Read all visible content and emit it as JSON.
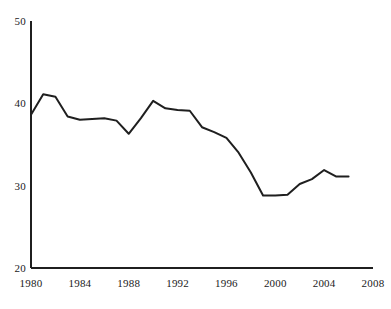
{
  "chart_data": {
    "type": "line",
    "title": "",
    "subtitle": "",
    "xlabel": "",
    "ylabel": "",
    "xlim": [
      1980,
      2008
    ],
    "ylim": [
      20,
      50
    ],
    "grid": false,
    "legend": null,
    "x_ticks": [
      "1980",
      "1984",
      "1988",
      "1992",
      "1996",
      "2000",
      "2004",
      "2008"
    ],
    "x_tick_values": [
      1980,
      1984,
      1988,
      1992,
      1996,
      2000,
      2004,
      2008
    ],
    "y_ticks": [
      "20",
      "30",
      "40",
      "50"
    ],
    "y_tick_values": [
      20,
      30,
      40,
      50
    ],
    "x": [
      1980,
      1981,
      1982,
      1983,
      1984,
      1985,
      1986,
      1987,
      1988,
      1989,
      1990,
      1991,
      1992,
      1993,
      1994,
      1995,
      1996,
      1997,
      1998,
      1999,
      2000,
      2001,
      2002,
      2003,
      2004,
      2005,
      2006
    ],
    "values": [
      38.6,
      41.1,
      40.8,
      38.4,
      38.0,
      38.1,
      38.2,
      37.9,
      36.3,
      38.2,
      40.3,
      39.4,
      39.2,
      39.1,
      37.1,
      36.5,
      35.8,
      34.0,
      31.6,
      28.8,
      28.8,
      28.9,
      30.2,
      30.8,
      31.9,
      31.1,
      31.1
    ],
    "series": [
      {
        "name": "series-1",
        "color": "#1f1f1f",
        "values": [
          38.6,
          41.1,
          40.8,
          38.4,
          38.0,
          38.1,
          38.2,
          37.9,
          36.3,
          38.2,
          40.3,
          39.4,
          39.2,
          39.1,
          37.1,
          36.5,
          35.8,
          34.0,
          31.6,
          28.8,
          28.8,
          28.9,
          30.2,
          30.8,
          31.9,
          31.1,
          31.1
        ]
      }
    ],
    "axis_color": "#1f1f1f",
    "line_color": "#1f1f1f",
    "line_width": 2,
    "background": "#ffffff"
  }
}
